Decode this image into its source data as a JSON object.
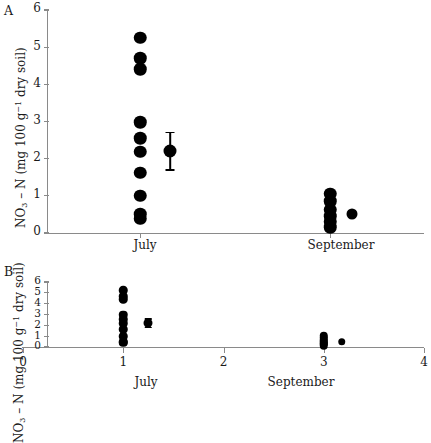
{
  "figure": {
    "panels": [
      {
        "id": "A",
        "label": "A",
        "ylabel_text": "NO3 – N (mg 100 g-1 dry soil)",
        "y_ticks": [
          "0",
          "1",
          "2",
          "3",
          "4",
          "5",
          "6"
        ],
        "x_category_labels": [
          "July",
          "September"
        ]
      },
      {
        "id": "B",
        "label": "B",
        "ylabel_text": "NO3 – N (mg 100 g-1 dry soil)",
        "y_ticks": [
          "0",
          "1",
          "2",
          "3",
          "4",
          "5",
          "6"
        ],
        "x_ticks": [
          "0",
          "1",
          "2",
          "3",
          "4"
        ],
        "x_category_labels": [
          "July",
          "September"
        ]
      }
    ]
  },
  "chart_data": [
    {
      "type": "scatter",
      "panel": "A",
      "title": "",
      "xlabel": "",
      "ylabel": "NO3 - N (mg 100 g-1 dry soil)",
      "ylim": [
        0,
        6
      ],
      "ytick_values": [
        0,
        1,
        2,
        3,
        4,
        5,
        6
      ],
      "grid": false,
      "legend": "none",
      "x_axis_type": "categorical",
      "categories": [
        "July",
        "September"
      ],
      "series": [
        {
          "name": "July individual observations",
          "x_category": "July",
          "values": [
            5.25,
            4.7,
            4.4,
            2.98,
            2.55,
            2.18,
            1.62,
            1.0,
            0.5,
            0.38
          ]
        },
        {
          "name": "September individual observations",
          "x_category": "September",
          "values": [
            1.05,
            0.85,
            0.62,
            0.45,
            0.3,
            0.15
          ]
        },
        {
          "name": "September offset observation",
          "x_category": "September",
          "values": [
            0.5
          ]
        }
      ],
      "mean_markers": [
        {
          "name": "July mean with SE",
          "x_category": "July",
          "mean": 2.2,
          "error_low": 1.7,
          "error_high": 2.7
        }
      ]
    },
    {
      "type": "scatter",
      "panel": "B",
      "title": "",
      "xlabel": "",
      "ylabel": "NO3 - N (mg 100 g-1 dry soil)",
      "ylim": [
        0,
        6
      ],
      "ytick_values": [
        0,
        1,
        2,
        3,
        4,
        5,
        6
      ],
      "xlim": [
        0,
        4
      ],
      "xtick_values": [
        0,
        1,
        2,
        3,
        4
      ],
      "grid": false,
      "legend": "none",
      "x_axis_type": "numeric",
      "category_positions": {
        "July": 1,
        "September": 3
      },
      "series": [
        {
          "name": "July individual observations",
          "x": 1,
          "values": [
            5.25,
            4.7,
            4.4,
            2.98,
            2.55,
            2.18,
            1.62,
            1.0,
            0.5,
            0.38
          ]
        },
        {
          "name": "September individual observations",
          "x": 3,
          "values": [
            1.05,
            0.85,
            0.62,
            0.45,
            0.3,
            0.15
          ]
        },
        {
          "name": "September offset observation",
          "x": 3.18,
          "values": [
            0.5
          ]
        }
      ],
      "mean_markers": [
        {
          "name": "July mean with SE",
          "x": 1.25,
          "mean": 2.2,
          "error_low": 1.82,
          "error_high": 2.6
        }
      ]
    }
  ]
}
